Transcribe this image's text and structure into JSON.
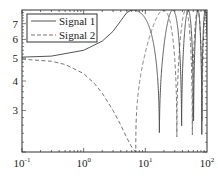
{
  "chart_data": {
    "type": "line",
    "title": "",
    "xlabel": "",
    "ylabel": "",
    "xscale": "log",
    "yscale": "log",
    "xlim": [
      0.1,
      100
    ],
    "ylim": [
      2,
      8
    ],
    "grid": false,
    "legend_position": "upper left",
    "x_ticks": [
      {
        "value": 0.1,
        "base": "10",
        "exp": "-1"
      },
      {
        "value": 1,
        "base": "10",
        "exp": "0"
      },
      {
        "value": 10,
        "base": "10",
        "exp": "1"
      },
      {
        "value": 100,
        "base": "10",
        "exp": "2"
      }
    ],
    "y_ticks": [
      {
        "value": 3,
        "label": "3"
      },
      {
        "value": 4,
        "label": "4"
      },
      {
        "value": 5,
        "label": "5"
      },
      {
        "value": 6,
        "label": "6"
      },
      {
        "value": 7,
        "label": "7"
      }
    ],
    "series": [
      {
        "name": "Signal 1",
        "style": "solid",
        "color": "#555555",
        "description": "Starts near 5 at x=0.1, rises slowly to ~8 near x=6, then oscillates between top and bottom with increasing frequency up to x=100",
        "x": [
          0.1,
          0.3,
          1,
          2,
          3,
          4,
          5,
          6,
          8,
          10,
          12,
          15,
          18,
          20
        ],
        "y": [
          5.05,
          5.1,
          5.4,
          5.9,
          6.5,
          7.2,
          7.8,
          8.0,
          7.6,
          6.0,
          4.0,
          2.5,
          2.0,
          2.0
        ]
      },
      {
        "name": "Signal 2",
        "style": "dashed",
        "color": "#777777",
        "description": "Starts near 5 at x=0.1, decreases to a minimum near x=7, then oscillates with increasing frequency up to x=100",
        "x": [
          0.1,
          0.3,
          0.5,
          1,
          1.5,
          2,
          3,
          4,
          5,
          6,
          7
        ],
        "y": [
          4.95,
          4.85,
          4.7,
          4.3,
          3.9,
          3.55,
          3.0,
          2.6,
          2.3,
          2.1,
          2.0
        ]
      }
    ]
  }
}
